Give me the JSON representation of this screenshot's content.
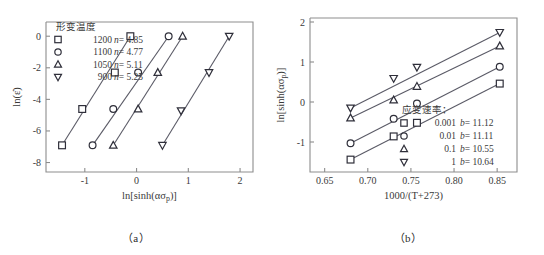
{
  "figure": {
    "panels": [
      {
        "caption": "（a）",
        "legend_title": "形变温度",
        "x_axis_title": "ln[sinh(ασ_p)]",
        "y_axis_title": "ln(ε̇)"
      },
      {
        "caption": "（b）",
        "legend_title": "应变速率：",
        "x_axis_title": "1000/(T+273)",
        "y_axis_title": "ln[sinh(ασ_p)]"
      }
    ]
  },
  "chart_data": [
    {
      "type": "scatter",
      "panel": "a",
      "title": "",
      "xlabel": "ln[sinh(ασ_p)]",
      "ylabel": "ln(ε̇)",
      "xlim": [
        -1.75,
        2.25
      ],
      "ylim": [
        -8.6,
        0.9
      ],
      "xticks": [
        -1,
        0,
        1,
        2
      ],
      "yticks": [
        0,
        -2,
        -4,
        -6,
        -8
      ],
      "xtick_labels": [
        "-1",
        "0",
        "1",
        "2"
      ],
      "ytick_labels": [
        "0",
        "-2",
        "-4",
        "-6",
        "-8"
      ],
      "grid": false,
      "legend_position": "top-left",
      "legend_title": "形变温度",
      "series": [
        {
          "name": "1200",
          "label": "1200",
          "slope_label": "n= 4.85",
          "marker": "square",
          "x": [
            -1.44,
            -1.05,
            -0.42,
            -0.12
          ],
          "y": [
            -6.91,
            -4.61,
            -2.3,
            0.0
          ]
        },
        {
          "name": "1100",
          "label": "1100",
          "slope_label": "n= 4.77",
          "marker": "circle",
          "x": [
            -0.85,
            -0.45,
            0.03,
            0.62
          ],
          "y": [
            -6.91,
            -4.61,
            -2.3,
            0.0
          ]
        },
        {
          "name": "1050",
          "label": "1050",
          "slope_label": "n= 5.11",
          "marker": "triangle-up",
          "x": [
            -0.45,
            0.03,
            0.41,
            0.89
          ],
          "y": [
            -6.91,
            -4.61,
            -2.3,
            0.0
          ]
        },
        {
          "name": "900",
          "label": "900",
          "slope_label": "n= 5.25",
          "marker": "triangle-down",
          "x": [
            0.5,
            0.86,
            1.4,
            1.79
          ],
          "y": [
            -6.91,
            -4.72,
            -2.3,
            0.0
          ]
        }
      ]
    },
    {
      "type": "scatter",
      "panel": "b",
      "title": "",
      "xlabel": "1000/(T+273)",
      "ylabel": "ln[sinh(ασ_p)]",
      "xlim": [
        0.633,
        0.873
      ],
      "ylim": [
        -1.75,
        2.1
      ],
      "xticks": [
        0.65,
        0.7,
        0.75,
        0.8,
        0.85
      ],
      "yticks": [
        2,
        1,
        0,
        -1
      ],
      "xtick_labels": [
        "0.65",
        "0.70",
        "0.75",
        "0.80",
        "0.85"
      ],
      "ytick_labels": [
        "2",
        "1",
        "0",
        "-1"
      ],
      "grid": false,
      "legend_position": "bottom-right",
      "legend_title": "应变速率：",
      "series": [
        {
          "name": "0.001",
          "label": "0.001",
          "slope_label": "b= 11.12",
          "marker": "square",
          "x": [
            0.68,
            0.73,
            0.757,
            0.853
          ],
          "y": [
            -1.44,
            -0.86,
            -0.52,
            0.46
          ]
        },
        {
          "name": "0.01",
          "label": "0.01",
          "slope_label": "b= 11.11",
          "marker": "circle",
          "x": [
            0.68,
            0.73,
            0.757,
            0.853
          ],
          "y": [
            -1.03,
            -0.42,
            -0.04,
            0.88
          ]
        },
        {
          "name": "0.1",
          "label": "0.1",
          "slope_label": "b= 10.55",
          "marker": "triangle-up",
          "x": [
            0.68,
            0.73,
            0.757,
            0.853
          ],
          "y": [
            -0.4,
            0.05,
            0.39,
            1.4
          ]
        },
        {
          "name": "1",
          "label": "1",
          "slope_label": "b= 10.64",
          "marker": "triangle-down",
          "x": [
            0.68,
            0.73,
            0.757,
            0.853
          ],
          "y": [
            -0.15,
            0.59,
            0.87,
            1.74
          ]
        }
      ]
    }
  ]
}
